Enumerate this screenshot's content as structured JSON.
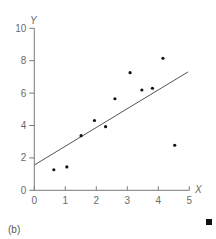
{
  "chart_data": {
    "type": "scatter",
    "title": "",
    "panel_label": "(b)",
    "xlabel": "X",
    "ylabel": "Y",
    "xlim": [
      0,
      5
    ],
    "ylim": [
      0,
      10
    ],
    "x_ticks": [
      0,
      1,
      2,
      3,
      4,
      5
    ],
    "y_ticks": [
      0,
      2,
      4,
      6,
      8,
      10
    ],
    "grid": false,
    "legend": null,
    "series": [
      {
        "name": "observations",
        "kind": "scatter",
        "x": [
          0.63,
          1.05,
          1.51,
          1.94,
          2.3,
          2.6,
          3.09,
          3.47,
          3.81,
          4.15,
          4.53
        ],
        "y": [
          1.27,
          1.44,
          3.37,
          4.31,
          3.93,
          5.65,
          7.26,
          6.19,
          6.3,
          8.15,
          2.78
        ]
      },
      {
        "name": "fitted line",
        "kind": "line",
        "x": [
          0,
          4.96
        ],
        "y": [
          1.56,
          7.31
        ]
      }
    ]
  },
  "colors": {
    "axis": "#7a7a7a",
    "points": "#111111",
    "line": "#555555",
    "text": "#6a6a6a",
    "marker": "#111111"
  },
  "labels": {
    "panel": "(b)",
    "x_axis": "X",
    "y_axis": "Y"
  }
}
